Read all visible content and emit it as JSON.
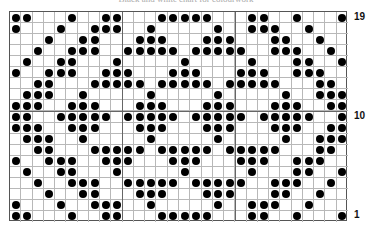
{
  "title": "Black and white chart for colourwork",
  "grid": {
    "columns": 30,
    "rows": 19,
    "cell_width": 11.27,
    "cell_height": 11.05,
    "dot_color": "#000000",
    "line_color": "#b8b8b8",
    "major_line_color": "#666666",
    "major_every": 10
  },
  "row_labels": [
    {
      "row": 19,
      "label": "19"
    },
    {
      "row": 10,
      "label": "10"
    },
    {
      "row": 1,
      "label": "1"
    }
  ],
  "rows_filled": {
    "19": [
      1,
      2,
      6,
      9,
      10,
      14,
      15,
      16,
      17,
      18,
      22,
      23,
      26,
      30
    ],
    "18": [
      1,
      5,
      8,
      9,
      10,
      13,
      19,
      22,
      23,
      24,
      27
    ],
    "17": [
      4,
      7,
      8,
      12,
      13,
      14,
      18,
      19,
      20,
      24,
      25,
      28
    ],
    "16": [
      3,
      6,
      7,
      8,
      11,
      12,
      13,
      14,
      15,
      17,
      18,
      19,
      20,
      21,
      24,
      25,
      26,
      29
    ],
    "15": [
      2,
      5,
      6,
      10,
      16,
      22,
      26,
      27,
      30
    ],
    "14": [
      1,
      4,
      5,
      6,
      9,
      10,
      11,
      15,
      16,
      17,
      21,
      22,
      23,
      26,
      27,
      28
    ],
    "13": [
      3,
      4,
      8,
      9,
      10,
      11,
      12,
      14,
      15,
      16,
      17,
      18,
      20,
      21,
      22,
      23,
      24,
      28,
      29
    ],
    "12": [
      2,
      3,
      4,
      7,
      13,
      19,
      25,
      28,
      29,
      30
    ],
    "11": [
      1,
      2,
      3,
      6,
      7,
      8,
      12,
      13,
      14,
      18,
      19,
      20,
      24,
      25,
      26,
      29,
      30
    ],
    "10": [
      1,
      2,
      5,
      6,
      7,
      8,
      9,
      11,
      12,
      13,
      14,
      15,
      17,
      18,
      19,
      20,
      21,
      23,
      24,
      25,
      26,
      27,
      30
    ],
    "9": [
      1,
      2,
      3,
      6,
      7,
      8,
      12,
      13,
      14,
      18,
      19,
      20,
      24,
      25,
      26,
      29,
      30
    ],
    "8": [
      2,
      3,
      4,
      7,
      13,
      19,
      25,
      28,
      29,
      30
    ],
    "7": [
      3,
      4,
      8,
      9,
      10,
      11,
      12,
      14,
      15,
      16,
      17,
      18,
      20,
      21,
      22,
      23,
      24,
      28,
      29
    ],
    "6": [
      1,
      4,
      5,
      6,
      9,
      10,
      11,
      15,
      16,
      17,
      21,
      22,
      23,
      26,
      27,
      28
    ],
    "5": [
      2,
      5,
      6,
      10,
      16,
      22,
      26,
      27,
      30
    ],
    "4": [
      3,
      6,
      7,
      8,
      11,
      12,
      13,
      14,
      15,
      17,
      18,
      19,
      20,
      21,
      24,
      25,
      26,
      29
    ],
    "3": [
      4,
      7,
      8,
      12,
      13,
      14,
      18,
      19,
      20,
      24,
      25,
      28
    ],
    "2": [
      1,
      5,
      8,
      9,
      10,
      13,
      19,
      22,
      23,
      24,
      27
    ],
    "1": [
      1,
      2,
      6,
      9,
      10,
      14,
      15,
      16,
      17,
      18,
      22,
      23,
      26,
      30
    ]
  }
}
